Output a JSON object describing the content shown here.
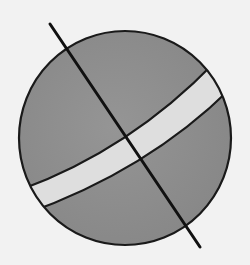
{
  "diagram": {
    "type": "sphere-with-axis-and-band",
    "colors": {
      "background": "#f2f2f2",
      "sphere_fill": "#8f8f8f",
      "band_fill": "#dedede",
      "stroke": "#1a1a1a"
    },
    "sphere": {
      "cx": 125,
      "cy": 138,
      "rx": 106,
      "ry": 107
    },
    "axis": {
      "x1": 50,
      "y1": 24,
      "x2": 200,
      "y2": 247
    },
    "band": {
      "upper_edge": {
        "x1": 33,
        "y1": 186,
        "cx": 130,
        "cy": 150,
        "x2": 203,
        "y2": 68
      },
      "lower_edge": {
        "x1": 48,
        "y1": 208,
        "cx": 150,
        "cy": 170,
        "x2": 217,
        "y2": 90
      }
    }
  }
}
